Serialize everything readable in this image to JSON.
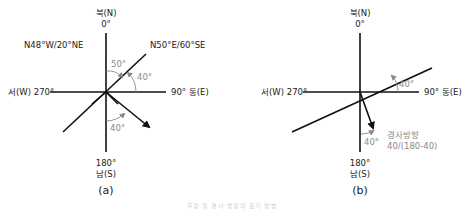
{
  "panel_a": {
    "north_label": "북(N)",
    "north_degree": "0°",
    "south_degree": "180°",
    "south_label": "남(S)",
    "west_label": "서(W) 270°",
    "east_label": "90° 동(E)",
    "plane1_label": "N48°W/20°NE",
    "plane2_label": "N50°E/60°SE",
    "angle_50": "50°",
    "angle_40_upper": "40°",
    "angle_40_lower": "40°",
    "caption": "(a)"
  },
  "panel_b": {
    "north_label": "북(N)",
    "north_degree": "0°",
    "south_degree": "180°",
    "south_label": "남(S)",
    "west_label": "서(W) 270°",
    "east_label": "90° 동(E)",
    "angle_40_upper": "40°",
    "angle_40_lower": "40°",
    "dip_direction_label": "경사방향",
    "dip_direction_value": "40/(180-40)",
    "caption": "(b)"
  },
  "figure_caption": "주향 및 경사 방향의 표기 방법",
  "colors": {
    "line": "#111111",
    "annotation": "#8a8a8a"
  }
}
